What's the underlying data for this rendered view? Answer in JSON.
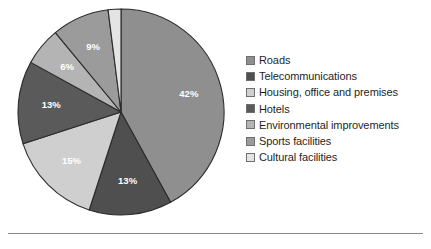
{
  "chart_data": {
    "type": "pie",
    "title": "",
    "subtitle": "",
    "xlabel": "",
    "ylabel": "",
    "grid": false,
    "legend_position": "right",
    "units": "percent",
    "total": 100,
    "categories": [
      "Roads",
      "Telecommunications",
      "Housing, office and premises",
      "Hotels",
      "Environmental improvements",
      "Sports facilities",
      "Cultural facilities"
    ],
    "values": [
      42,
      13,
      15,
      13,
      6,
      9,
      2
    ],
    "data_labels": [
      "42%",
      "13%",
      "15%",
      "13%",
      "6%",
      "9%",
      "2%"
    ],
    "colors": [
      "#8f8f8f",
      "#4f4f4f",
      "#cfcfcf",
      "#5a5a5a",
      "#b4b4b4",
      "#9b9b9b",
      "#e4e4e4"
    ],
    "slices": [
      {
        "label": "Roads",
        "value": 42,
        "data_label": "42%",
        "color": "#8f8f8f",
        "label_color": "#ffffff",
        "label_inside": true
      },
      {
        "label": "Telecommunications",
        "value": 13,
        "data_label": "13%",
        "color": "#4f4f4f",
        "label_color": "#ffffff",
        "label_inside": true
      },
      {
        "label": "Housing, office and premises",
        "value": 15,
        "data_label": "15%",
        "color": "#cfcfcf",
        "label_color": "#ffffff",
        "label_inside": true
      },
      {
        "label": "Hotels",
        "value": 13,
        "data_label": "13%",
        "color": "#5a5a5a",
        "label_color": "#ffffff",
        "label_inside": true
      },
      {
        "label": "Environmental improvements",
        "value": 6,
        "data_label": "6%",
        "color": "#b4b4b4",
        "label_color": "#ffffff",
        "label_inside": true
      },
      {
        "label": "Sports facilities",
        "value": 9,
        "data_label": "9%",
        "color": "#9b9b9b",
        "label_color": "#ffffff",
        "label_inside": true
      },
      {
        "label": "Cultural facilities",
        "value": 2,
        "data_label": "2%",
        "color": "#e4e4e4",
        "label_color": "#1c1c1c",
        "label_inside": false
      }
    ]
  },
  "legend": {
    "items": [
      {
        "label": "Roads",
        "color": "#8f8f8f"
      },
      {
        "label": "Telecommunications",
        "color": "#4f4f4f"
      },
      {
        "label": "Housing, office and premises",
        "color": "#cfcfcf"
      },
      {
        "label": "Hotels",
        "color": "#5a5a5a"
      },
      {
        "label": "Environmental improvements",
        "color": "#b4b4b4"
      },
      {
        "label": "Sports facilities",
        "color": "#9b9b9b"
      },
      {
        "label": "Cultural facilities",
        "color": "#e4e4e4"
      }
    ]
  },
  "style": {
    "background": "#ffffff",
    "slice_border": "#2b2b2b",
    "divider_color": "#8a8a8a",
    "text_color": "#1f1f1f"
  }
}
